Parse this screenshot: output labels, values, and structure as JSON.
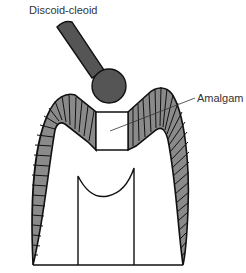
{
  "diagram": {
    "type": "dental-cross-section",
    "labels": {
      "instrument": "Discoid-cleoid",
      "material": "Amalgam"
    },
    "colors": {
      "background": "#ffffff",
      "instrument_fill": "#555555",
      "enamel_fill": "#8a8a8a",
      "outline": "#111111",
      "label_text": "#333333",
      "leader_line": "#333333"
    },
    "components": [
      {
        "id": "instrument",
        "name": "Discoid-cleoid instrument",
        "parts": [
          "handle",
          "ball-tip"
        ]
      },
      {
        "id": "enamel",
        "name": "Enamel layer (striated)"
      },
      {
        "id": "amalgam",
        "name": "Amalgam restoration in occlusal cavity"
      },
      {
        "id": "dentin",
        "name": "Dentin"
      },
      {
        "id": "pulp",
        "name": "Pulp chamber"
      }
    ]
  }
}
